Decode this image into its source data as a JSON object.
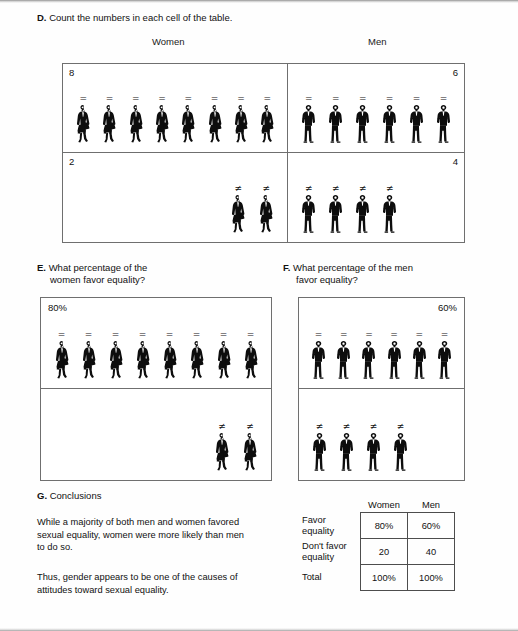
{
  "document": {
    "sections": {
      "d": {
        "label": "D.",
        "title": "Count the numbers in each cell of the table.",
        "column_headers": {
          "women": "Women",
          "men": "Men"
        },
        "cells": [
          {
            "name": "women-favor",
            "count": "8",
            "count_align": "left",
            "figure": "woman",
            "symbol": "=",
            "figure_count": 8,
            "align": "left"
          },
          {
            "name": "men-favor",
            "count": "6",
            "count_align": "right",
            "figure": "man",
            "symbol": "=",
            "figure_count": 6,
            "align": "left"
          },
          {
            "name": "women-dont-favor",
            "count": "2",
            "count_align": "left",
            "figure": "woman",
            "symbol": "≠",
            "figure_count": 2,
            "align": "right"
          },
          {
            "name": "men-dont-favor",
            "count": "4",
            "count_align": "right",
            "figure": "man",
            "symbol": "≠",
            "figure_count": 4,
            "align": "left"
          }
        ]
      },
      "e": {
        "label": "E.",
        "title_line1": "What percentage of the",
        "title_line2": "women favor equality?",
        "percent_label": "80%",
        "percent_align": "left",
        "top_symbol": "=",
        "top_figure_count": 8,
        "top_align": "left",
        "bottom_symbol": "≠",
        "bottom_figure_count": 2,
        "bottom_align": "right",
        "figure": "woman"
      },
      "f": {
        "label": "F.",
        "title_line1": "What percentage of the men",
        "title_line2": "favor equality?",
        "percent_label": "60%",
        "percent_align": "right",
        "top_symbol": "=",
        "top_figure_count": 6,
        "top_align": "left",
        "bottom_symbol": "≠",
        "bottom_figure_count": 4,
        "bottom_align": "left",
        "figure": "man"
      },
      "g": {
        "label": "G.",
        "title": "Conclusions",
        "paragraph_1": "While a majority of both men and women favored sexual equality, women were more likely than men to do so.",
        "paragraph_2": "Thus, gender appears to be one of the causes of attitudes toward sexual equality.",
        "summary_table": {
          "column_headers": [
            "Women",
            "Men"
          ],
          "rows": [
            {
              "label_line1": "Favor",
              "label_line2": "equality",
              "women": "80%",
              "men": "60%"
            },
            {
              "label_line1": "Don't favor",
              "label_line2": "equality",
              "women": "20",
              "men": "40"
            },
            {
              "label_line1": "Total",
              "label_line2": "",
              "women": "100%",
              "men": "100%"
            }
          ]
        }
      }
    }
  },
  "chart_data": {
    "type": "table",
    "categories": [
      "Women",
      "Men"
    ],
    "series": [
      {
        "name": "Favor equality (count)",
        "values": [
          8,
          6
        ]
      },
      {
        "name": "Don't favor equality (count)",
        "values": [
          2,
          4
        ]
      },
      {
        "name": "Favor equality (percent)",
        "values": [
          80,
          60
        ]
      },
      {
        "name": "Don't favor equality (percent)",
        "values": [
          20,
          40
        ]
      },
      {
        "name": "Total (percent)",
        "values": [
          100,
          100
        ]
      }
    ],
    "xlabel": "Gender",
    "ylabel": "Count / Percentage",
    "grid": false,
    "legend": "none"
  },
  "colors": {
    "ink": "#111111",
    "rule": "#6f6f6f",
    "paper": "#ffffff"
  }
}
